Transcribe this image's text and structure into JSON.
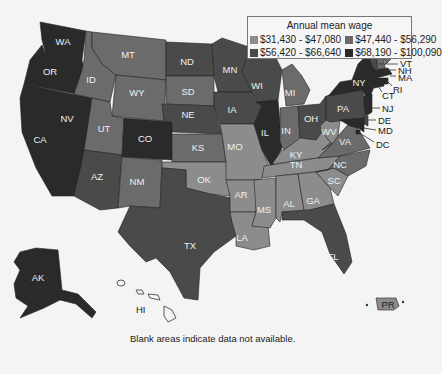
{
  "legend": {
    "title": "Annual mean wage",
    "bins": [
      {
        "label": "$31,430 - $47,080",
        "color": "#8c8c8c"
      },
      {
        "label": "$47,440 - $56,290",
        "color": "#6b6b6b"
      },
      {
        "label": "$56,420 - $66,640",
        "color": "#4a4a4a"
      },
      {
        "label": "$68,190 - $100,090",
        "color": "#2a2a2a"
      }
    ]
  },
  "note": "Blank areas indicate data not available.",
  "states": {
    "WA": {
      "label": "WA",
      "bin": 3
    },
    "OR": {
      "label": "OR",
      "bin": 3
    },
    "CA": {
      "label": "CA",
      "bin": 3
    },
    "NV": {
      "label": "NV",
      "bin": 3
    },
    "ID": {
      "label": "ID",
      "bin": 1
    },
    "MT": {
      "label": "MT",
      "bin": 1
    },
    "WY": {
      "label": "WY",
      "bin": 1
    },
    "UT": {
      "label": "UT",
      "bin": 1
    },
    "AZ": {
      "label": "AZ",
      "bin": 2
    },
    "CO": {
      "label": "CO",
      "bin": 3
    },
    "NM": {
      "label": "NM",
      "bin": 1
    },
    "ND": {
      "label": "ND",
      "bin": 2
    },
    "SD": {
      "label": "SD",
      "bin": 1
    },
    "NE": {
      "label": "NE",
      "bin": 2
    },
    "KS": {
      "label": "KS",
      "bin": 1
    },
    "OK": {
      "label": "OK",
      "bin": 0
    },
    "TX": {
      "label": "TX",
      "bin": 2
    },
    "MN": {
      "label": "MN",
      "bin": 2
    },
    "IA": {
      "label": "IA",
      "bin": 2
    },
    "MO": {
      "label": "MO",
      "bin": 0
    },
    "AR": {
      "label": "AR",
      "bin": 0
    },
    "LA": {
      "label": "LA",
      "bin": 0
    },
    "WI": {
      "label": "WI",
      "bin": 2
    },
    "IL": {
      "label": "IL",
      "bin": 3
    },
    "MI": {
      "label": "MI",
      "bin": 1
    },
    "IN": {
      "label": "IN",
      "bin": 1
    },
    "OH": {
      "label": "OH",
      "bin": 2
    },
    "KY": {
      "label": "KY",
      "bin": 0
    },
    "TN": {
      "label": "TN",
      "bin": 0
    },
    "MS": {
      "label": "MS",
      "bin": 0
    },
    "AL": {
      "label": "AL",
      "bin": 0
    },
    "GA": {
      "label": "GA",
      "bin": 0
    },
    "FL": {
      "label": "FL",
      "bin": 2
    },
    "SC": {
      "label": "SC",
      "bin": 0
    },
    "NC": {
      "label": "NC",
      "bin": 1
    },
    "VA": {
      "label": "VA",
      "bin": 1
    },
    "WV": {
      "label": "WV",
      "bin": 0
    },
    "PA": {
      "label": "PA",
      "bin": 2
    },
    "NY": {
      "label": "NY",
      "bin": 3
    },
    "ME": {
      "label": "ME",
      "bin": 1
    },
    "VT": {
      "label": "VT",
      "bin": 2
    },
    "NH": {
      "label": "NH",
      "bin": 1
    },
    "MA": {
      "label": "MA",
      "bin": 3
    },
    "RI": {
      "label": "RI",
      "bin": 3
    },
    "CT": {
      "label": "CT",
      "bin": 3
    },
    "NJ": {
      "label": "NJ",
      "bin": 3
    },
    "DE": {
      "label": "DE",
      "bin": 2
    },
    "MD": {
      "label": "MD",
      "bin": 3
    },
    "DC": {
      "label": "DC",
      "bin": 3
    },
    "AK": {
      "label": "AK",
      "bin": 3
    },
    "HI": {
      "label": "HI",
      "bin": null
    },
    "PR": {
      "label": "PR",
      "bin": 0
    }
  }
}
